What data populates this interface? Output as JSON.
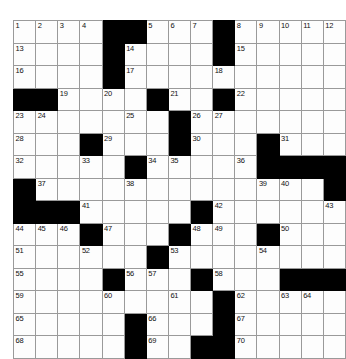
{
  "puzzle": {
    "type": "crossword-grid",
    "rows": 15,
    "columns": 15,
    "cell_size_px": 21.3,
    "colors": {
      "block": "#000000",
      "cell": "#fdfdfd",
      "grid_line": "#9a9a9a",
      "border": "#000000",
      "number_text": "#111111",
      "page_background": "#ffffff"
    },
    "highest_number": 70,
    "legend": {
      "black_code": 1,
      "white_code": 0
    },
    "blocks": [
      [
        0,
        0,
        0,
        0,
        1,
        1,
        0,
        0,
        0,
        1,
        0,
        0,
        0,
        0,
        0
      ],
      [
        0,
        0,
        0,
        0,
        1,
        0,
        0,
        0,
        0,
        1,
        0,
        0,
        0,
        0,
        0
      ],
      [
        0,
        0,
        0,
        0,
        1,
        0,
        0,
        0,
        0,
        0,
        0,
        0,
        0,
        0,
        0
      ],
      [
        1,
        1,
        0,
        0,
        0,
        0,
        1,
        0,
        0,
        1,
        0,
        0,
        0,
        0,
        0
      ],
      [
        0,
        0,
        0,
        0,
        0,
        0,
        0,
        1,
        0,
        0,
        0,
        0,
        0,
        0,
        0
      ],
      [
        0,
        0,
        0,
        1,
        0,
        0,
        0,
        1,
        0,
        0,
        0,
        1,
        0,
        0,
        0
      ],
      [
        0,
        0,
        0,
        0,
        0,
        1,
        0,
        0,
        0,
        0,
        0,
        1,
        1,
        1,
        1
      ],
      [
        1,
        0,
        0,
        0,
        0,
        0,
        0,
        0,
        0,
        0,
        0,
        0,
        0,
        0,
        1
      ],
      [
        1,
        1,
        1,
        0,
        0,
        0,
        0,
        0,
        1,
        0,
        0,
        0,
        0,
        0,
        0
      ],
      [
        0,
        0,
        0,
        1,
        0,
        0,
        0,
        1,
        0,
        0,
        0,
        1,
        0,
        0,
        0
      ],
      [
        0,
        0,
        0,
        0,
        0,
        0,
        1,
        0,
        0,
        0,
        0,
        0,
        0,
        0,
        0
      ],
      [
        0,
        0,
        0,
        0,
        1,
        0,
        0,
        0,
        1,
        0,
        0,
        0,
        1,
        1,
        1
      ],
      [
        0,
        0,
        0,
        0,
        0,
        0,
        0,
        0,
        0,
        1,
        0,
        0,
        0,
        0,
        0
      ],
      [
        0,
        0,
        0,
        0,
        0,
        1,
        0,
        0,
        0,
        1,
        0,
        0,
        0,
        0,
        0
      ],
      [
        0,
        0,
        0,
        0,
        0,
        1,
        0,
        0,
        1,
        1,
        0,
        0,
        0,
        0,
        0
      ]
    ],
    "numbers": [
      [
        1,
        2,
        3,
        4,
        null,
        null,
        5,
        6,
        7,
        null,
        8,
        9,
        10,
        11,
        12
      ],
      [
        13,
        null,
        null,
        null,
        null,
        14,
        null,
        null,
        null,
        null,
        15,
        null,
        null,
        null,
        null
      ],
      [
        16,
        null,
        null,
        null,
        null,
        17,
        null,
        null,
        null,
        18,
        null,
        null,
        null,
        null,
        null
      ],
      [
        null,
        null,
        19,
        null,
        20,
        null,
        null,
        21,
        null,
        null,
        22,
        null,
        null,
        null,
        null
      ],
      [
        23,
        24,
        null,
        null,
        null,
        25,
        null,
        null,
        26,
        27,
        null,
        null,
        null,
        null,
        null
      ],
      [
        28,
        null,
        null,
        null,
        29,
        null,
        null,
        null,
        30,
        null,
        null,
        null,
        31,
        null,
        null
      ],
      [
        32,
        null,
        null,
        33,
        null,
        null,
        34,
        35,
        null,
        null,
        36,
        null,
        null,
        null,
        null
      ],
      [
        null,
        37,
        null,
        null,
        null,
        38,
        null,
        null,
        null,
        null,
        null,
        39,
        40,
        null,
        null
      ],
      [
        null,
        null,
        null,
        41,
        null,
        null,
        null,
        null,
        null,
        42,
        null,
        null,
        null,
        null,
        43
      ],
      [
        44,
        45,
        46,
        null,
        47,
        null,
        null,
        null,
        48,
        49,
        null,
        null,
        50,
        null,
        null
      ],
      [
        51,
        null,
        null,
        52,
        null,
        null,
        null,
        53,
        null,
        null,
        null,
        54,
        null,
        null,
        null
      ],
      [
        55,
        null,
        null,
        null,
        null,
        56,
        57,
        null,
        null,
        58,
        null,
        null,
        null,
        null,
        null
      ],
      [
        59,
        null,
        null,
        null,
        60,
        null,
        null,
        61,
        null,
        null,
        62,
        null,
        63,
        64,
        null
      ],
      [
        65,
        null,
        null,
        null,
        null,
        null,
        66,
        null,
        null,
        null,
        67,
        null,
        null,
        null,
        null
      ],
      [
        68,
        null,
        null,
        null,
        null,
        null,
        69,
        null,
        null,
        null,
        70,
        null,
        null,
        null,
        null
      ]
    ]
  }
}
